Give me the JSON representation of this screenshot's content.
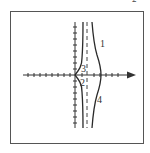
{
  "figure": {
    "corner_label": "2",
    "curve_labels": {
      "c1": "1",
      "c2": "2",
      "c3": "3",
      "c4": "4"
    },
    "colors": {
      "axis": "#333333",
      "curve": "#2a2a2a",
      "asymptote": "#444444",
      "frame": "#555555"
    }
  }
}
